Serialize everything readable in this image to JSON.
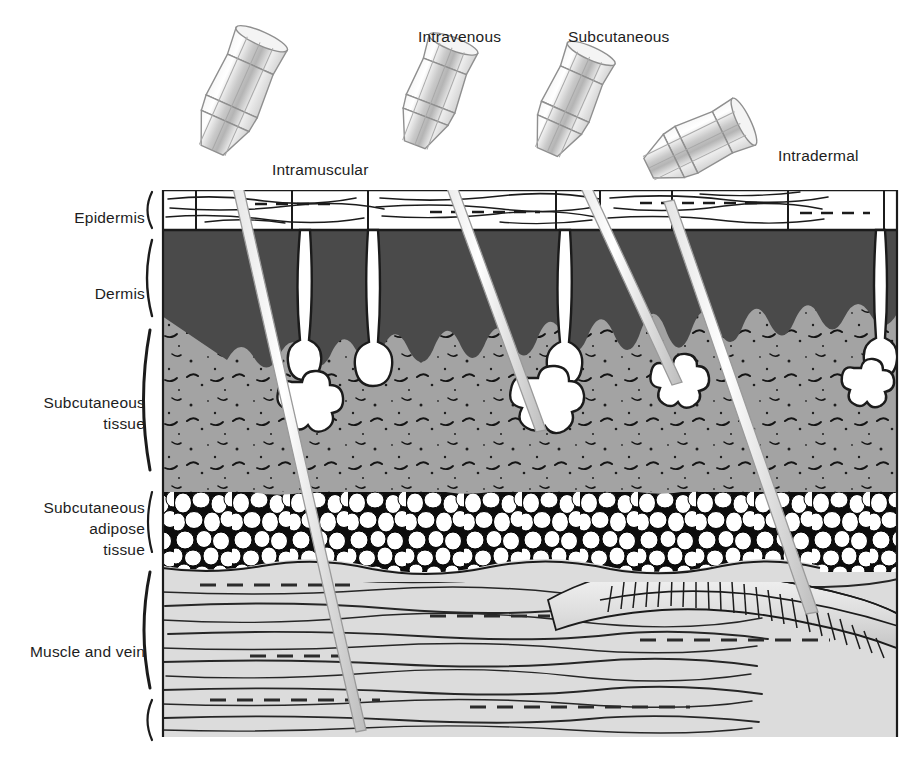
{
  "figure": {
    "type": "anatomical-cross-section",
    "background_color": "#ffffff"
  },
  "layer_labels": [
    {
      "id": "epidermis",
      "text": "Epidermis"
    },
    {
      "id": "dermis",
      "text": "Dermis"
    },
    {
      "id": "subcutaneous-tissue",
      "line1": "Subcutaneous",
      "line2": "tissue"
    },
    {
      "id": "subcutaneous-adipose-tissue",
      "line1": "Subcutaneous",
      "line2": "adipose",
      "line3": "tissue"
    },
    {
      "id": "muscle-and-vein",
      "text": "Muscle and vein"
    }
  ],
  "injection_labels": [
    {
      "id": "intramuscular",
      "text": "Intramuscular"
    },
    {
      "id": "intravenous",
      "text": "Intravenous"
    },
    {
      "id": "subcutaneous",
      "text": "Subcutaneous"
    },
    {
      "id": "intradermal",
      "text": "Intradermal"
    }
  ],
  "colors": {
    "epidermis": "#ffffff",
    "dermis": "#4a4a4a",
    "subcutaneous_tissue": "#a3a3a3",
    "adipose_background": "#0d0d0d",
    "adipose_cells": "#ffffff",
    "muscle": "#dcdcdc",
    "vein": "#e8e8e8",
    "needle_metal": "#f2f2f2",
    "outline": "#1b1b1b",
    "text": "#1d1d1d"
  },
  "layer_bounds_px": {
    "diagram_left": 162,
    "diagram_right": 898,
    "epidermis_top": 190,
    "dermis_top": 232,
    "subcutaneous_top": 318,
    "adipose_top": 487,
    "muscle_top": 568,
    "diagram_bottom": 737
  },
  "needles": [
    {
      "id": "intramuscular",
      "angle_deg": 62,
      "tip_depth_layer": "muscle"
    },
    {
      "id": "intravenous",
      "angle_deg": 66,
      "tip_depth_layer": "subcutaneous tissue"
    },
    {
      "id": "subcutaneous",
      "angle_deg": 60,
      "tip_depth_layer": "subcutaneous tissue"
    },
    {
      "id": "intradermal",
      "angle_deg": 20,
      "tip_depth_layer": "epidermis"
    }
  ]
}
